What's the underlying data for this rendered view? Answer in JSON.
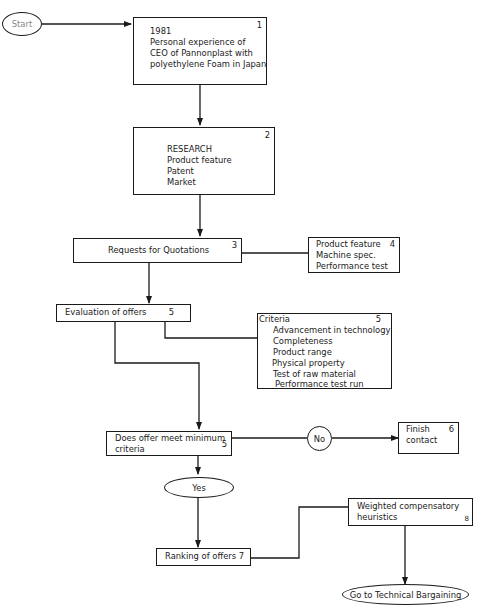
{
  "diagram": {
    "start": {
      "label": "Start"
    },
    "box1": {
      "num": "1",
      "lines": [
        "1981",
        "Personal experience of",
        "CEO of Pannonplast with",
        "polyethylene Foam in Japan"
      ]
    },
    "box2": {
      "num": "2",
      "lines": [
        "RESEARCH",
        "Product feature",
        "Patent",
        "Market"
      ]
    },
    "box3": {
      "num": "3",
      "label": "Requests for Quotations"
    },
    "box4": {
      "num": "4",
      "lines": [
        "Product feature",
        "Machine spec.",
        "Performance test"
      ]
    },
    "box5_eval": {
      "num": "5",
      "label": "Evaluation of offers"
    },
    "box5_criteria": {
      "num": "5",
      "title": "Criteria",
      "lines": [
        "Advancement in technology",
        "Completeness",
        "Product range",
        "Physical property",
        "Test of raw material",
        "Performance test run"
      ]
    },
    "box5_decision": {
      "num": "5",
      "lines": [
        "Does offer meet minimum",
        "criteria"
      ]
    },
    "no": {
      "label": "No"
    },
    "box6": {
      "num": "6",
      "lines": [
        "Finish",
        "contact"
      ]
    },
    "yes": {
      "label": "Yes"
    },
    "box7": {
      "label": "Ranking of offers 7"
    },
    "box8": {
      "num": "8",
      "lines": [
        "Weighted compensatory",
        "heuristics"
      ]
    },
    "end": {
      "label": "Go to Technical Bargaining"
    }
  },
  "colors": {
    "stroke": "#1a1a1a",
    "background": "#ffffff"
  }
}
